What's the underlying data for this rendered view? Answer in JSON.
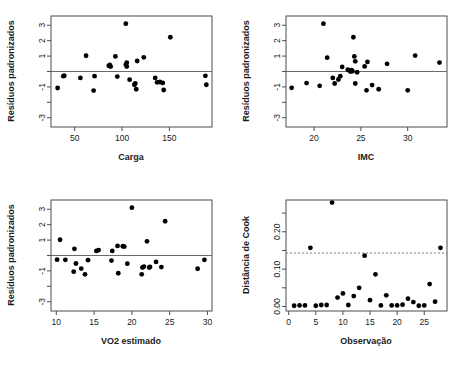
{
  "figure": {
    "title": "",
    "background": "#ffffff",
    "point_color": "#000000",
    "reference_line_color": "#6b6b6b",
    "cutoff_line_color": "#808080",
    "panel_layout": "2x2"
  },
  "chart_data": [
    {
      "id": "carga",
      "type": "scatter",
      "title": "",
      "xlabel": "Carga",
      "ylabel": "Resíduos padronizados",
      "xlim": [
        25,
        195
      ],
      "ylim": [
        -3.6,
        3.6
      ],
      "xticks": [
        50,
        100,
        150
      ],
      "xtick_labels": [
        "50",
        "100",
        "150"
      ],
      "yticks": [
        -3,
        -2,
        -1,
        0,
        1,
        2,
        3
      ],
      "ytick_labels": [
        "-3",
        "",
        "-1",
        "",
        "1",
        "2",
        "3"
      ],
      "grid": false,
      "legend": "none",
      "reference_line": {
        "orientation": "horizontal",
        "y": 0,
        "style": "solid"
      },
      "x": [
        32,
        38,
        39,
        56,
        62,
        70,
        71,
        86,
        87,
        88,
        93,
        95,
        104,
        104,
        105,
        105,
        108,
        113,
        114,
        115,
        116,
        123,
        135,
        137,
        140,
        143,
        144,
        151,
        188,
        189
      ],
      "y": [
        -1.07,
        -0.3,
        -0.27,
        -0.42,
        1.02,
        -1.24,
        -0.3,
        0.37,
        0.43,
        0.32,
        0.98,
        -0.33,
        3.1,
        0.45,
        0.32,
        0.57,
        -0.53,
        -0.86,
        -0.78,
        -1.15,
        0.68,
        0.92,
        -0.42,
        -0.7,
        -0.68,
        -0.74,
        -1.2,
        2.22,
        -0.28,
        -0.86
      ]
    },
    {
      "id": "imc",
      "type": "scatter",
      "title": "",
      "xlabel": "IMC",
      "ylabel": "Resíduos padronizados",
      "xlim": [
        17.0,
        34.2
      ],
      "ylim": [
        -3.6,
        3.6
      ],
      "xticks": [
        20,
        25,
        30
      ],
      "xtick_labels": [
        "20",
        "25",
        "30"
      ],
      "yticks": [
        -3,
        -2,
        -1,
        0,
        1,
        2,
        3
      ],
      "ytick_labels": [
        "-3",
        "",
        "-1",
        "",
        "1",
        "2",
        "3"
      ],
      "grid": false,
      "legend": "none",
      "reference_line": {
        "orientation": "horizontal",
        "y": 0,
        "style": "solid"
      },
      "x": [
        17.6,
        19.2,
        20.6,
        21.0,
        21.4,
        22.0,
        22.2,
        22.6,
        22.8,
        23.0,
        23.6,
        23.8,
        23.9,
        24.0,
        24.1,
        24.2,
        24.3,
        24.4,
        24.4,
        24.6,
        25.4,
        25.6,
        25.7,
        26.2,
        26.9,
        27.8,
        30.0,
        30.8,
        33.4
      ],
      "y": [
        -1.06,
        -0.75,
        -0.93,
        3.1,
        0.9,
        -0.42,
        -0.78,
        -0.52,
        -0.3,
        0.3,
        0.12,
        0.05,
        0.0,
        0.08,
        0.02,
        2.22,
        0.98,
        0.66,
        -0.78,
        -0.05,
        0.33,
        -1.22,
        0.62,
        -0.88,
        -1.15,
        0.5,
        -1.22,
        1.03,
        0.58
      ]
    },
    {
      "id": "vo2",
      "type": "scatter",
      "title": "",
      "xlabel": "VO2 estimado",
      "ylabel": "Resíduos padronizados",
      "xlim": [
        9.3,
        30.6
      ],
      "ylim": [
        -3.6,
        3.6
      ],
      "xticks": [
        10,
        15,
        20,
        25,
        30
      ],
      "xtick_labels": [
        "10",
        "15",
        "20",
        "25",
        "30"
      ],
      "yticks": [
        -3,
        -2,
        -1,
        0,
        1,
        2,
        3
      ],
      "ytick_labels": [
        "-3",
        "",
        "-1",
        "",
        "1",
        "2",
        "3"
      ],
      "grid": false,
      "legend": "none",
      "reference_line": {
        "orientation": "horizontal",
        "y": 0,
        "style": "solid"
      },
      "x": [
        10.1,
        10.5,
        11.2,
        12.3,
        12.4,
        12.6,
        13.3,
        13.8,
        14.2,
        15.3,
        15.6,
        17.3,
        17.4,
        18.1,
        18.2,
        18.8,
        19.0,
        19.4,
        20.0,
        21.3,
        21.4,
        21.6,
        22.0,
        22.3,
        22.4,
        23.2,
        23.9,
        24.4,
        28.7,
        29.6
      ],
      "y": [
        -0.27,
        1.02,
        -0.28,
        -1.05,
        0.43,
        -0.52,
        -0.85,
        -1.22,
        -0.3,
        0.3,
        0.35,
        -0.33,
        0.3,
        0.62,
        -1.15,
        0.6,
        0.58,
        -0.53,
        3.1,
        -1.22,
        -0.78,
        -0.72,
        0.92,
        -0.78,
        -0.74,
        -0.42,
        -0.75,
        2.22,
        -0.86,
        -0.28
      ]
    },
    {
      "id": "cook",
      "type": "scatter",
      "title": "",
      "xlabel": "Observação",
      "ylabel": "Distância de Cook",
      "xlim": [
        -0.5,
        29.2
      ],
      "ylim": [
        -0.012,
        0.285
      ],
      "xticks": [
        0,
        5,
        10,
        15,
        20,
        25
      ],
      "xtick_labels": [
        "0",
        "5",
        "10",
        "15",
        "20",
        "25"
      ],
      "yticks": [
        0.0,
        0.05,
        0.1,
        0.15,
        0.2,
        0.25
      ],
      "ytick_labels": [
        "0.00",
        "",
        "0.10",
        "",
        "0.20",
        ""
      ],
      "grid": false,
      "legend": "none",
      "cutoff_line": {
        "orientation": "horizontal",
        "y": 0.143,
        "style": "dashed"
      },
      "x": [
        1,
        2,
        3,
        4,
        5,
        6,
        7,
        8,
        9,
        10,
        11,
        12,
        13,
        14,
        15,
        16,
        17,
        18,
        19,
        20,
        21,
        22,
        23,
        24,
        25,
        26,
        27,
        28
      ],
      "y": [
        0.002,
        0.003,
        0.003,
        0.157,
        0.002,
        0.004,
        0.004,
        0.278,
        0.024,
        0.035,
        0.004,
        0.028,
        0.05,
        0.136,
        0.017,
        0.086,
        0.003,
        0.03,
        0.003,
        0.003,
        0.005,
        0.021,
        0.012,
        0.002,
        0.003,
        0.06,
        0.013,
        0.157
      ]
    }
  ]
}
